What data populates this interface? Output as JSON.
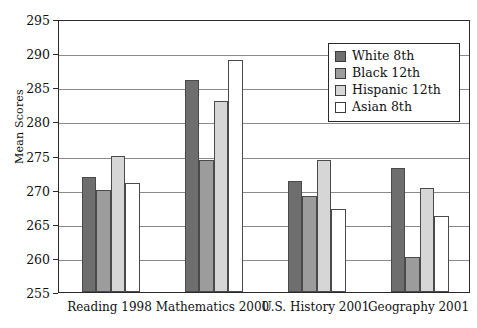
{
  "chart_data": {
    "type": "bar",
    "title": "",
    "xlabel": "",
    "ylabel": "Mean Scores",
    "ylim": [
      255,
      295
    ],
    "ytick_step": 5,
    "yticks": [
      255,
      260,
      265,
      270,
      275,
      280,
      285,
      290,
      295
    ],
    "grid": true,
    "legend_position": "top-right",
    "categories": [
      "Reading 1998",
      "Mathematics 2000",
      "U.S. History 2001",
      "Geography 2001"
    ],
    "series": [
      {
        "name": "White 8th",
        "color": "#6e6e6e",
        "values": [
          271.8,
          286.1,
          271.3,
          273.2
        ]
      },
      {
        "name": "Black 12th",
        "color": "#9c9c9c",
        "values": [
          270.0,
          274.3,
          269.1,
          260.2
        ]
      },
      {
        "name": "Hispanic 12th",
        "color": "#d6d6d6",
        "values": [
          275.0,
          283.0,
          274.3,
          270.3
        ]
      },
      {
        "name": "Asian 8th",
        "color": "#ffffff",
        "values": [
          271.0,
          289.0,
          267.1,
          266.1
        ]
      }
    ]
  },
  "legend": {
    "items": [
      {
        "label": "White 8th"
      },
      {
        "label": "Black 12th"
      },
      {
        "label": "Hispanic 12th"
      },
      {
        "label": "Asian 8th"
      }
    ]
  },
  "axis": {
    "y_title": "Mean Scores"
  }
}
